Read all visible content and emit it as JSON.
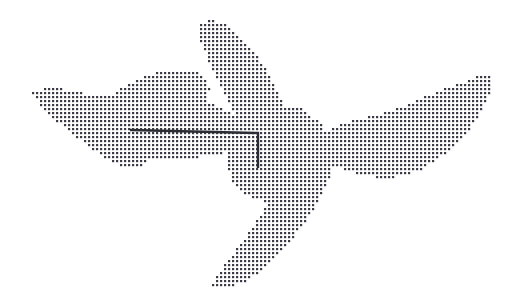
{
  "figure": {
    "title": "Dotted halftone bird silhouette with overlay polyline",
    "caption": "",
    "width": 520,
    "height": 304,
    "background_color": "#ffffff"
  },
  "chart_data": {
    "type": "scatter",
    "title": "",
    "subtitle": "",
    "xlabel": "",
    "ylabel": "",
    "xlim": [
      0,
      520
    ],
    "ylim": [
      0,
      304
    ],
    "grid": false,
    "legend": null,
    "tick_labels": {
      "x": [],
      "y": []
    },
    "annotations": [],
    "marker": {
      "shape": "square",
      "size_px": 2.2,
      "color": "#3c3c46",
      "lattice_spacing_px": 4.0,
      "lattice_origin": [
        1.0,
        1.0
      ]
    },
    "regions": [
      {
        "name": "left-wing",
        "fill": "dots",
        "polygon": [
          [
            32,
            90
          ],
          [
            57,
            88
          ],
          [
            78,
            92
          ],
          [
            96,
            96
          ],
          [
            110,
            95
          ],
          [
            128,
            84
          ],
          [
            150,
            74
          ],
          [
            172,
            70
          ],
          [
            196,
            72
          ],
          [
            208,
            80
          ],
          [
            210,
            90
          ],
          [
            206,
            101
          ],
          [
            213,
            104
          ],
          [
            222,
            108
          ],
          [
            232,
            114
          ],
          [
            240,
            120
          ],
          [
            244,
            128
          ],
          [
            243,
            141
          ],
          [
            235,
            150
          ],
          [
            210,
            156
          ],
          [
            176,
            159
          ],
          [
            150,
            160
          ],
          [
            139,
            167
          ],
          [
            122,
            166
          ],
          [
            108,
            160
          ],
          [
            96,
            152
          ],
          [
            84,
            143
          ],
          [
            70,
            132
          ],
          [
            58,
            122
          ],
          [
            48,
            113
          ],
          [
            40,
            104
          ],
          [
            34,
            96
          ]
        ]
      },
      {
        "name": "upper-blade",
        "fill": "dots",
        "polygon": [
          [
            199,
            22
          ],
          [
            214,
            20
          ],
          [
            226,
            24
          ],
          [
            236,
            32
          ],
          [
            248,
            44
          ],
          [
            259,
            58
          ],
          [
            268,
            72
          ],
          [
            275,
            86
          ],
          [
            281,
            100
          ],
          [
            286,
            116
          ],
          [
            290,
            132
          ],
          [
            292,
            146
          ],
          [
            288,
            150
          ],
          [
            270,
            150
          ],
          [
            256,
            148
          ],
          [
            248,
            138
          ],
          [
            240,
            124
          ],
          [
            232,
            108
          ],
          [
            224,
            92
          ],
          [
            216,
            76
          ],
          [
            208,
            60
          ],
          [
            202,
            44
          ],
          [
            198,
            32
          ]
        ]
      },
      {
        "name": "right-wing",
        "fill": "dots",
        "polygon": [
          [
            492,
            77
          ],
          [
            480,
            76
          ],
          [
            468,
            80
          ],
          [
            452,
            86
          ],
          [
            436,
            92
          ],
          [
            418,
            100
          ],
          [
            400,
            107
          ],
          [
            382,
            113
          ],
          [
            364,
            118
          ],
          [
            348,
            122
          ],
          [
            336,
            126
          ],
          [
            328,
            132
          ],
          [
            322,
            140
          ],
          [
            320,
            149
          ],
          [
            324,
            158
          ],
          [
            334,
            166
          ],
          [
            350,
            172
          ],
          [
            368,
            176
          ],
          [
            386,
            178
          ],
          [
            404,
            176
          ],
          [
            420,
            170
          ],
          [
            436,
            160
          ],
          [
            452,
            148
          ],
          [
            466,
            134
          ],
          [
            478,
            118
          ],
          [
            486,
            102
          ],
          [
            491,
            88
          ]
        ]
      },
      {
        "name": "lower-blade",
        "fill": "dots",
        "polygon": [
          [
            212,
            286
          ],
          [
            226,
            288
          ],
          [
            240,
            284
          ],
          [
            254,
            276
          ],
          [
            268,
            264
          ],
          [
            282,
            250
          ],
          [
            296,
            234
          ],
          [
            308,
            218
          ],
          [
            318,
            202
          ],
          [
            326,
            186
          ],
          [
            332,
            170
          ],
          [
            334,
            158
          ],
          [
            330,
            152
          ],
          [
            312,
            152
          ],
          [
            296,
            156
          ],
          [
            288,
            166
          ],
          [
            280,
            182
          ],
          [
            270,
            200
          ],
          [
            258,
            218
          ],
          [
            246,
            236
          ],
          [
            234,
            252
          ],
          [
            224,
            266
          ],
          [
            216,
            278
          ]
        ]
      },
      {
        "name": "core-body",
        "fill": "dots",
        "polygon": [
          [
            236,
            110
          ],
          [
            268,
            104
          ],
          [
            300,
            108
          ],
          [
            322,
            124
          ],
          [
            332,
            146
          ],
          [
            330,
            170
          ],
          [
            316,
            190
          ],
          [
            294,
            200
          ],
          [
            268,
            202
          ],
          [
            246,
            196
          ],
          [
            232,
            180
          ],
          [
            226,
            158
          ],
          [
            228,
            132
          ]
        ]
      }
    ],
    "overlay_polyline": {
      "name": "measurement-polyline",
      "stroke_color": "#2b2b33",
      "stroke_width_px": 2.4,
      "points": [
        [
          130,
          130
        ],
        [
          258,
          133
        ],
        [
          258,
          168
        ]
      ]
    }
  }
}
